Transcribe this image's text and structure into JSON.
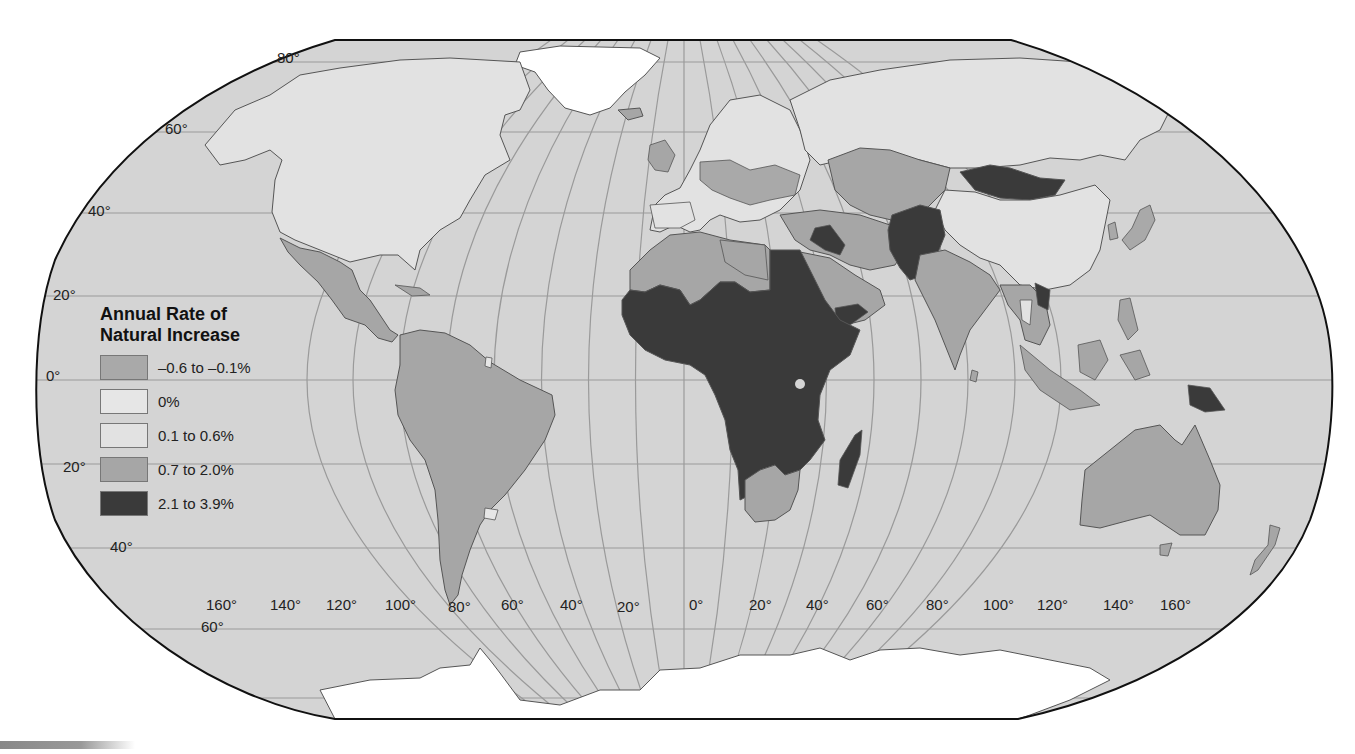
{
  "legend": {
    "title_line1": "Annual Rate of",
    "title_line2": "Natural Increase",
    "items": [
      {
        "label": "–0.6 to –0.1%",
        "color": "#a9a9a9"
      },
      {
        "label": "0%",
        "color": "#e6e6e6"
      },
      {
        "label": "0.1 to 0.6%",
        "color": "#e2e2e2"
      },
      {
        "label": "0.7 to 2.0%",
        "color": "#a6a6a6"
      },
      {
        "label": "2.1 to 3.9%",
        "color": "#3a3a3a"
      }
    ]
  },
  "latitude_labels": [
    {
      "text": "80°",
      "x": 277,
      "y": 64
    },
    {
      "text": "60°",
      "x": 165,
      "y": 135
    },
    {
      "text": "40°",
      "x": 88,
      "y": 217
    },
    {
      "text": "20°",
      "x": 53,
      "y": 301
    },
    {
      "text": "0°",
      "x": 46,
      "y": 382
    },
    {
      "text": "20°",
      "x": 63,
      "y": 473
    },
    {
      "text": "40°",
      "x": 110,
      "y": 553
    },
    {
      "text": "60°",
      "x": 201,
      "y": 633
    }
  ],
  "longitude_labels": [
    {
      "text": "160°",
      "x": 206,
      "y": 611
    },
    {
      "text": "140°",
      "x": 270,
      "y": 611
    },
    {
      "text": "120°",
      "x": 326,
      "y": 611
    },
    {
      "text": "100°",
      "x": 385,
      "y": 611
    },
    {
      "text": "80°",
      "x": 448,
      "y": 613
    },
    {
      "text": "60°",
      "x": 501,
      "y": 611
    },
    {
      "text": "40°",
      "x": 560,
      "y": 611
    },
    {
      "text": "20°",
      "x": 617,
      "y": 613
    },
    {
      "text": "0°",
      "x": 689,
      "y": 611
    },
    {
      "text": "20°",
      "x": 749,
      "y": 611
    },
    {
      "text": "40°",
      "x": 806,
      "y": 611
    },
    {
      "text": "60°",
      "x": 866,
      "y": 611
    },
    {
      "text": "80°",
      "x": 926,
      "y": 611
    },
    {
      "text": "100°",
      "x": 983,
      "y": 611
    },
    {
      "text": "120°",
      "x": 1037,
      "y": 611
    },
    {
      "text": "140°",
      "x": 1103,
      "y": 611
    },
    {
      "text": "160°",
      "x": 1160,
      "y": 611
    }
  ],
  "colors": {
    "ocean": "#d4d4d4",
    "ice": "#ffffff",
    "graticule": "#9a9a9a",
    "border": "#111111",
    "country_border": "#555555"
  }
}
